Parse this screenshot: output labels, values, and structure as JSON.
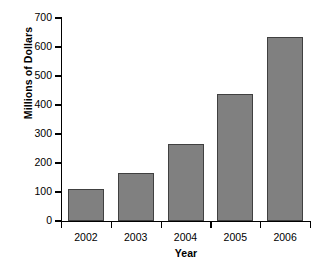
{
  "chart_data": {
    "type": "bar",
    "title": "",
    "xlabel": "Year",
    "ylabel": "Millions of Dollars",
    "categories": [
      "2002",
      "2003",
      "2004",
      "2005",
      "2006"
    ],
    "values": [
      112,
      165,
      265,
      438,
      635
    ],
    "ylim": [
      0,
      700
    ],
    "yticks": [
      0,
      100,
      200,
      300,
      400,
      500,
      600,
      700
    ],
    "ytick_labels": [
      "0",
      "100",
      "200",
      "300",
      "400",
      "500",
      "600",
      "700"
    ],
    "grid": false,
    "legend": null,
    "bar_color": "#808080",
    "bar_edge_color": "#404040",
    "axis_color": "#000000",
    "background_color": "#ffffff"
  }
}
